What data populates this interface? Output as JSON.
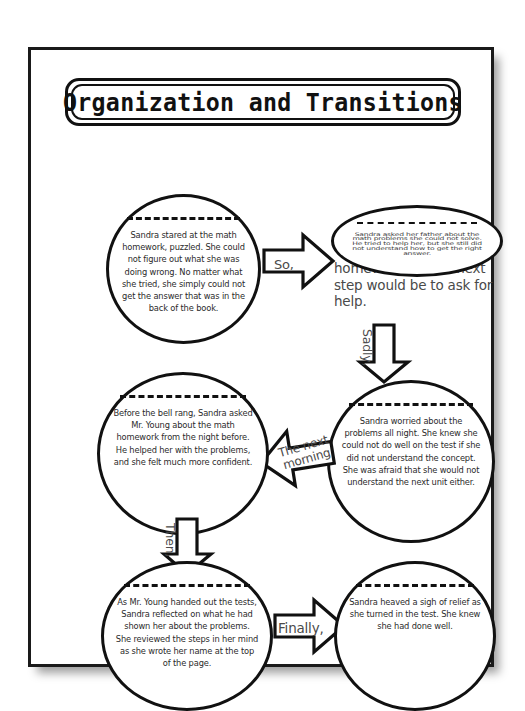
{
  "page": {
    "title": "Organization and Transitions"
  },
  "bubbles": [
    {
      "id": "bubble-1",
      "text": "Sandra stared at the math homework, puzzled. She could not figure out what she was doing wrong. No matter what she tried, she simply could not get the answer that was in the back of the book."
    },
    {
      "id": "bubble-2",
      "text": "Sandra asked her father about the math problems she could not solve. He tried to help her, but she still did not understand how to get the right answer.",
      "overflow_text": "homework, so the next step would be to ask for help."
    },
    {
      "id": "bubble-3",
      "text": "Sandra worried about the problems all night. She knew she could not do well on the test if she did not understand the concept. She was afraid that she would not understand the next unit either."
    },
    {
      "id": "bubble-4",
      "text": "Before the bell rang, Sandra asked Mr. Young about the math homework from the night before. He helped her with the problems, and she felt much more confident."
    },
    {
      "id": "bubble-5",
      "text": "As Mr. Young handed out the tests, Sandra reflected on what he had shown her about the problems. She reviewed the steps  in her mind as she wrote her name at the top of the page."
    },
    {
      "id": "bubble-6",
      "text": "Sandra heaved a sigh of relief as she turned in the test. She knew she had done well."
    }
  ],
  "arrows": [
    {
      "id": "arrow-so",
      "label": "So,",
      "direction": "right"
    },
    {
      "id": "arrow-sadly",
      "label": "Sadly,",
      "direction": "down"
    },
    {
      "id": "arrow-morning",
      "label": "The next morning",
      "direction": "left"
    },
    {
      "id": "arrow-then",
      "label": "Then,",
      "direction": "down"
    },
    {
      "id": "arrow-finally",
      "label": "Finally,",
      "direction": "right"
    }
  ],
  "colors": {
    "ink": "#111111",
    "text": "#3a3a3a",
    "paper": "#ffffff"
  }
}
